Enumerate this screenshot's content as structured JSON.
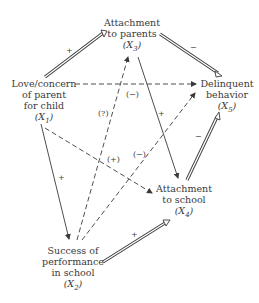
{
  "nodes": {
    "x1": {
      "lines": [
        "Love/concern",
        "of parent",
        "for child"
      ],
      "var": "(X",
      "sub": "1",
      "close": ")"
    },
    "x2": {
      "lines": [
        "Success of",
        "performance",
        "in school"
      ],
      "var": "(X",
      "sub": "2",
      "close": ")"
    },
    "x3": {
      "lines": [
        "Attachment",
        "to parents"
      ],
      "var": "(X",
      "sub": "3",
      "close": ")"
    },
    "x4": {
      "lines": [
        "Attachment",
        "to school"
      ],
      "var": "(X",
      "sub": "4",
      "close": ")"
    },
    "x5": {
      "lines": [
        "Delinquent",
        "behavior"
      ],
      "var": "(X",
      "sub": "5",
      "close": ")"
    }
  },
  "edges": [
    {
      "from": "X1",
      "to": "X3",
      "style": "double",
      "sign": "+"
    },
    {
      "from": "X3",
      "to": "X5",
      "style": "double",
      "sign": "−"
    },
    {
      "from": "X1",
      "to": "X5",
      "style": "dashed",
      "sign": "(−)"
    },
    {
      "from": "X3",
      "to": "X4",
      "style": "solid",
      "sign": "+"
    },
    {
      "from": "X2",
      "to": "X3",
      "style": "dashed",
      "sign": "(?)"
    },
    {
      "from": "X1",
      "to": "X4",
      "style": "dashed",
      "sign": "(+)"
    },
    {
      "from": "X2",
      "to": "X5",
      "style": "dashed",
      "sign": "(−)"
    },
    {
      "from": "X1",
      "to": "X2",
      "style": "solid",
      "sign": "+"
    },
    {
      "from": "X4",
      "to": "X5",
      "style": "double",
      "sign": "−"
    },
    {
      "from": "X2",
      "to": "X4",
      "style": "double",
      "sign": "+"
    }
  ],
  "signs": {
    "x1_x3": "+",
    "x3_x5": "−",
    "x1_x5": "(−)",
    "x3_x4": "+",
    "x2_x3": "(?)",
    "x1_x4": "(+)",
    "x2_x5": "(−)",
    "x1_x2": "+",
    "x4_x5": "−",
    "x2_x4": "+"
  },
  "colors": {
    "ink": "#3a3a3a",
    "background": "#ffffff"
  }
}
